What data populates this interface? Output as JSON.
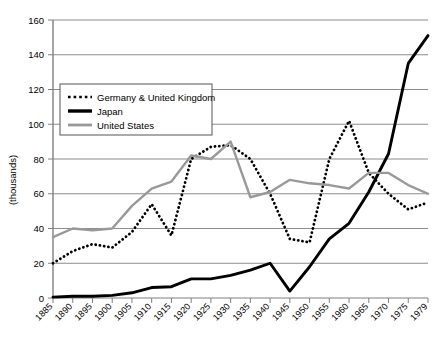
{
  "chart_data": {
    "type": "line",
    "title": "",
    "xlabel": "",
    "ylabel": "(thousands)",
    "xlim": [
      1885,
      1979
    ],
    "ylim": [
      0,
      160
    ],
    "grid": true,
    "legend_position": "upper-left-inside",
    "x": [
      1885,
      1890,
      1895,
      1900,
      1905,
      1910,
      1915,
      1920,
      1925,
      1930,
      1935,
      1940,
      1945,
      1950,
      1955,
      1960,
      1965,
      1970,
      1975,
      1979
    ],
    "categories": [
      "1885",
      "1890",
      "1895",
      "1900",
      "1905",
      "1910",
      "1915",
      "1920",
      "1925",
      "1930",
      "1935",
      "1940",
      "1945",
      "1950",
      "1955",
      "1960",
      "1965",
      "1970",
      "1975",
      "1979"
    ],
    "series": [
      {
        "name": "Germany & United Kingdom",
        "color": "#000000",
        "style": "dotted",
        "values": [
          20,
          27,
          31,
          29,
          38,
          54,
          36,
          80,
          87,
          88,
          80,
          60,
          34,
          32,
          80,
          102,
          72,
          60,
          51,
          55
        ]
      },
      {
        "name": "Japan",
        "color": "#000000",
        "style": "solid-thick",
        "values": [
          0.5,
          1,
          1,
          1.5,
          3,
          6,
          6.5,
          11,
          11,
          13,
          16,
          20,
          4,
          18,
          34,
          43,
          61,
          83,
          135,
          151
        ]
      },
      {
        "name": "United States",
        "color": "#999999",
        "style": "solid-gray",
        "values": [
          35,
          40,
          39,
          40,
          53,
          63,
          67,
          82,
          80,
          90,
          58,
          61,
          68,
          66,
          65,
          63,
          72,
          72,
          65,
          60
        ]
      }
    ],
    "yticks": [
      0,
      20,
      40,
      60,
      80,
      100,
      120,
      140,
      160
    ],
    "ytick_labels": [
      "0",
      "20",
      "40",
      "60",
      "80",
      "100",
      "120",
      "140",
      "160"
    ]
  },
  "legend": {
    "entries": [
      {
        "label": "Germany & United Kingdom"
      },
      {
        "label": "Japan"
      },
      {
        "label": "United States"
      }
    ]
  },
  "axes": {
    "y_axis_title": "(thousands)"
  }
}
